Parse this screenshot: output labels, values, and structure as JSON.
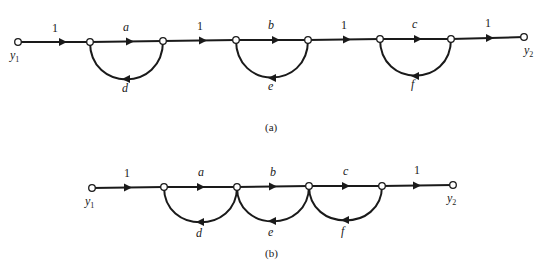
{
  "diagram_a": {
    "caption": "(a)",
    "input_label": "y",
    "input_sub": "1",
    "output_label": "y",
    "output_sub": "2",
    "forward_gains": [
      "1",
      "a",
      "1",
      "b",
      "1",
      "c",
      "1"
    ],
    "feedback_gains": [
      "d",
      "e",
      "f"
    ]
  },
  "diagram_b": {
    "caption": "(b)",
    "input_label": "y",
    "input_sub": "1",
    "output_label": "y",
    "output_sub": "2",
    "forward_gains": [
      "1",
      "a",
      "b",
      "c",
      "1"
    ],
    "feedback_gains": [
      "d",
      "e",
      "f"
    ]
  },
  "colors": {
    "ink": "#1a1a1a",
    "background": "#ffffff"
  }
}
